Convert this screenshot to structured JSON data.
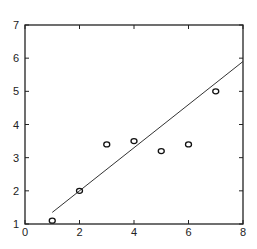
{
  "chart_data": {
    "type": "scatter",
    "title": "",
    "xlabel": "",
    "ylabel": "",
    "xlim": [
      0,
      8
    ],
    "ylim": [
      1,
      7
    ],
    "grid": false,
    "legend": null,
    "x_ticks": [
      "0",
      "2",
      "4",
      "6",
      "8"
    ],
    "y_ticks": [
      "1",
      "2",
      "3",
      "4",
      "5",
      "6",
      "7"
    ],
    "series": [
      {
        "name": "data",
        "type": "scatter",
        "marker": "circle-open",
        "x": [
          1,
          2,
          3,
          4,
          5,
          6,
          7
        ],
        "y": [
          1.1,
          2.0,
          3.4,
          3.5,
          3.2,
          3.4,
          5.0
        ]
      },
      {
        "name": "fit",
        "type": "line",
        "x": [
          1,
          8
        ],
        "y": [
          1.35,
          5.9
        ]
      }
    ]
  }
}
